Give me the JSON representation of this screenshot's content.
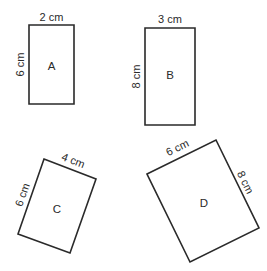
{
  "diagram": {
    "stroke_color": "#2a2a2a",
    "background": "#ffffff",
    "shapes": [
      {
        "label": "A",
        "width_label": "2 cm",
        "height_label": "6 cm",
        "width_cm": 2,
        "height_cm": 6,
        "rotation": "upright",
        "points": "29,25 74,25 74,104 29,104"
      },
      {
        "label": "B",
        "width_label": "3 cm",
        "height_label": "8 cm",
        "width_cm": 3,
        "height_cm": 8,
        "rotation": "upright",
        "points": "145,28 195,28 195,125 145,125"
      },
      {
        "label": "C",
        "width_label": "4 cm",
        "height_label": "6 cm",
        "width_cm": 4,
        "height_cm": 6,
        "rotation": "tilted",
        "points": "44,159 96,179 70,253 18,234"
      },
      {
        "label": "D",
        "width_label": "6 cm",
        "height_label": "8 cm",
        "width_cm": 6,
        "height_cm": 8,
        "rotation": "tilted",
        "points": "147,174 216,140 259,228 190,262"
      }
    ]
  }
}
